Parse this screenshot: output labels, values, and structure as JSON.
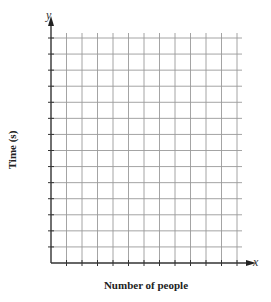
{
  "chart_data": {
    "type": "scatter",
    "title": "",
    "xlabel": "Number of people",
    "ylabel": "Time (s)",
    "x_axis_variable": "x",
    "y_axis_variable": "y",
    "series": [],
    "grid": true,
    "grid_columns": 12,
    "grid_rows": 14,
    "tick_labels_x": [],
    "tick_labels_y": [],
    "legend": null
  },
  "colors": {
    "grid": "#9a9a9a",
    "axis": "#333333",
    "text": "#222222"
  }
}
